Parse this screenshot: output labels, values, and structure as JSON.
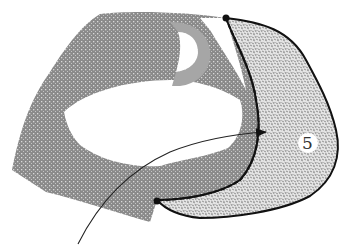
{
  "diagram": {
    "region_label": "5",
    "colors": {
      "gray_band": "#8e8e8e",
      "gray_band_light": "#a8a8a8",
      "speckled_region": "#d6d6d6",
      "outline": "#111111",
      "background": "#ffffff"
    },
    "elements": [
      {
        "name": "gray-stippled-band",
        "description": "curved gray stippled hook-shaped band"
      },
      {
        "name": "inner-d-shape",
        "description": "small gray D-shaped ring near top"
      },
      {
        "name": "speckled-region-5",
        "description": "light speckled region bordered by thick black outline, labeled 5"
      },
      {
        "name": "beaded-boundary",
        "description": "dotted/beaded boundary between gray band and region 5, with endpoint dots"
      },
      {
        "name": "entry-arrow",
        "description": "thin curved arrow entering from bottom-left into region 5"
      }
    ]
  }
}
